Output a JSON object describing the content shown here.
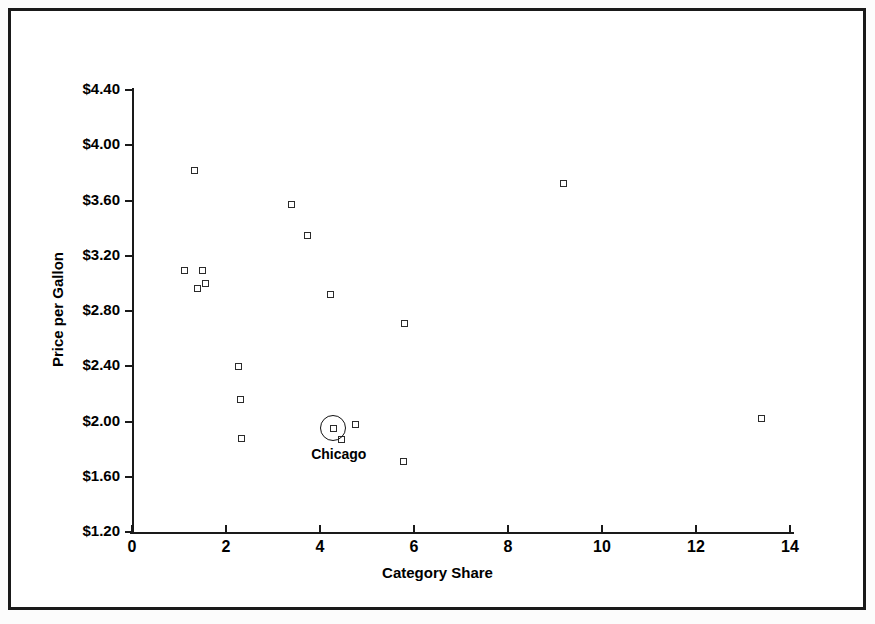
{
  "chart_data": {
    "type": "scatter",
    "title": "",
    "xlabel": "Category Share",
    "ylabel": "Price per Gallon",
    "xlim": [
      0,
      14
    ],
    "ylim": [
      1.2,
      4.4
    ],
    "xticks": [
      "0",
      "2",
      "4",
      "6",
      "8",
      "10",
      "12",
      "14"
    ],
    "xtick_values": [
      0,
      2,
      4,
      6,
      8,
      10,
      12,
      14
    ],
    "yticks": [
      "$1.20",
      "$1.60",
      "$2.00",
      "$2.40",
      "$2.80",
      "$3.20",
      "$3.60",
      "$4.00",
      "$4.40"
    ],
    "ytick_values": [
      1.2,
      1.6,
      2.0,
      2.4,
      2.8,
      3.2,
      3.6,
      4.0,
      4.4
    ],
    "grid": false,
    "legend": false,
    "marker": "open-square",
    "points": [
      {
        "x": 1.34,
        "y": 3.82
      },
      {
        "x": 1.11,
        "y": 3.09
      },
      {
        "x": 1.49,
        "y": 3.09
      },
      {
        "x": 1.4,
        "y": 2.96
      },
      {
        "x": 1.57,
        "y": 3.0
      },
      {
        "x": 2.26,
        "y": 2.4
      },
      {
        "x": 2.3,
        "y": 2.16
      },
      {
        "x": 2.34,
        "y": 1.88
      },
      {
        "x": 3.4,
        "y": 3.57
      },
      {
        "x": 3.74,
        "y": 3.35
      },
      {
        "x": 4.23,
        "y": 2.92
      },
      {
        "x": 4.28,
        "y": 1.95
      },
      {
        "x": 4.45,
        "y": 1.87
      },
      {
        "x": 4.76,
        "y": 1.98
      },
      {
        "x": 5.79,
        "y": 2.71
      },
      {
        "x": 5.77,
        "y": 1.71
      },
      {
        "x": 9.19,
        "y": 3.72
      },
      {
        "x": 13.4,
        "y": 2.02
      }
    ],
    "annotations": [
      {
        "label": "Chicago",
        "x": 4.28,
        "y": 1.95,
        "highlight": "circle"
      }
    ]
  },
  "axes": {
    "x_axis_name": "category-share-axis",
    "y_axis_name": "price-per-gallon-axis"
  }
}
